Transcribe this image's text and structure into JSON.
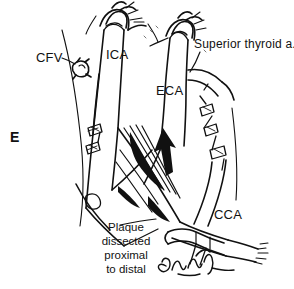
{
  "figure": {
    "panel_letter": "E",
    "background_color": "#ffffff",
    "ink_color": "#111111"
  },
  "labels": {
    "ica": "ICA",
    "eca": "ECA",
    "cca": "CCA",
    "cfv": "CFV",
    "superior_thyroid": "Superior thyroid a."
  },
  "caption": {
    "line1": "Plaque",
    "line2": "dissected",
    "line3": "proximal",
    "line4": "to distal"
  },
  "signature": {
    "text": "artist-signature"
  },
  "annotations": {
    "arrow": "dissection-direction-arrow",
    "clamp_ica": "vascular-clamp-ica",
    "clamp_eca": "vascular-clamp-eca",
    "clamp_cca": "vascular-clamp-cca",
    "clip_cfv": "vessel-clip-cfv",
    "sutures_right": "suture-stitch-chain-right",
    "sutures_left": "suture-stitch-chain-left"
  }
}
